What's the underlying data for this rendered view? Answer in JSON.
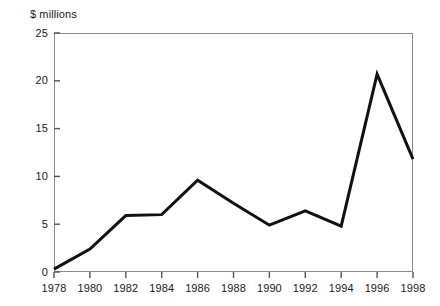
{
  "chart_data": {
    "type": "line",
    "title": "",
    "subtitle": "",
    "xlabel": "",
    "ylabel": "$ millions",
    "ylim": [
      0,
      25
    ],
    "xlim": [
      1978,
      1998
    ],
    "yticks": [
      0,
      5,
      10,
      15,
      20,
      25
    ],
    "ytick_labels": [
      "0",
      "5",
      "10",
      "15",
      "20",
      "25"
    ],
    "xticks": [
      1978,
      1980,
      1982,
      1984,
      1986,
      1988,
      1990,
      1992,
      1994,
      1996,
      1998
    ],
    "xtick_labels": [
      "1978",
      "1980",
      "1982",
      "1984",
      "1986",
      "1988",
      "1990",
      "1992",
      "1994",
      "1996",
      "1998"
    ],
    "grid": false,
    "legend": null,
    "annotations": [],
    "series": [
      {
        "name": "",
        "color": "#111111",
        "line_width": 3,
        "x": [
          1978,
          1980,
          1982,
          1984,
          1986,
          1988,
          1990,
          1992,
          1994,
          1996,
          1998
        ],
        "values": [
          0.3,
          2.4,
          5.9,
          6.0,
          9.6,
          7.2,
          4.9,
          6.4,
          4.8,
          20.7,
          11.8
        ]
      }
    ]
  },
  "axis": {
    "y_title": "$ millions"
  }
}
